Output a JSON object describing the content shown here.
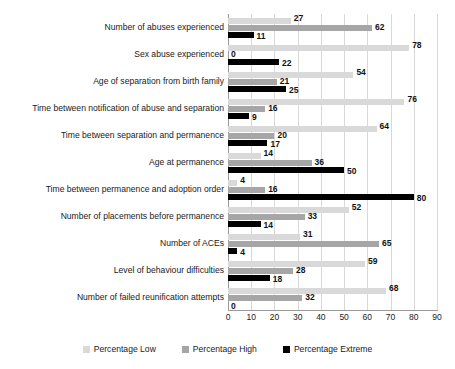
{
  "chart_data": {
    "type": "bar",
    "orientation": "horizontal",
    "title": "",
    "xlabel": "",
    "ylabel": "",
    "xlim": [
      0,
      90
    ],
    "xticks": [
      0,
      10,
      20,
      30,
      40,
      50,
      60,
      70,
      80,
      90
    ],
    "grid": true,
    "legend_position": "bottom",
    "categories": [
      "Number of abuses experienced",
      "Sex abuse experienced",
      "Age of separation from birth family",
      "Time between notification of abuse and separation",
      "Time between separation and permanence",
      "Age at permanence",
      "Time between permanence and adoption order",
      "Number of placements before permanence",
      "Number of ACEs",
      "Level of behaviour difficulties",
      "Number of failed reunification attempts"
    ],
    "series": [
      {
        "name": "Percentage Low",
        "color": "#d9d9d9",
        "values": [
          27,
          78,
          54,
          76,
          64,
          14,
          4,
          52,
          31,
          59,
          68
        ]
      },
      {
        "name": "Percentage High",
        "color": "#a6a6a6",
        "values": [
          62,
          0,
          21,
          16,
          20,
          36,
          16,
          33,
          65,
          28,
          32
        ]
      },
      {
        "name": "Percentage Extreme",
        "color": "#000000",
        "values": [
          11,
          22,
          25,
          9,
          17,
          50,
          80,
          14,
          4,
          18,
          0
        ]
      }
    ]
  },
  "legend": {
    "items": [
      {
        "label": "Percentage Low",
        "color": "#d9d9d9"
      },
      {
        "label": "Percentage High",
        "color": "#a6a6a6"
      },
      {
        "label": "Percentage Extreme",
        "color": "#000000"
      }
    ]
  }
}
